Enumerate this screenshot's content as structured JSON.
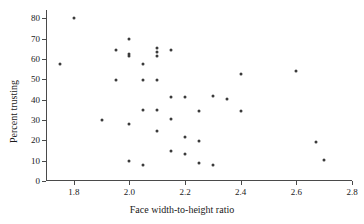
{
  "chart_data": {
    "type": "scatter",
    "title": "",
    "xlabel": "Face width-to-height ratio",
    "ylabel": "Percent trusting",
    "xlim": [
      1.7,
      2.8
    ],
    "ylim": [
      0,
      84
    ],
    "grid": false,
    "legend": "none",
    "xticks": [
      1.8,
      2.0,
      2.2,
      2.4,
      2.6,
      2.8
    ],
    "xtick_labels": [
      "1.8",
      "2.0",
      "2.2",
      "2.4",
      "2.6",
      "2.8"
    ],
    "yticks": [
      0,
      10,
      20,
      30,
      40,
      50,
      60,
      70,
      80
    ],
    "ytick_labels": [
      "0",
      "10",
      "20",
      "30",
      "40",
      "50",
      "60",
      "70",
      "80"
    ],
    "marker": "filled-circle",
    "marker_color": "#3b3b3b",
    "points": [
      {
        "x": 1.75,
        "y": 57.5
      },
      {
        "x": 1.8,
        "y": 80.0
      },
      {
        "x": 1.9,
        "y": 29.8
      },
      {
        "x": 1.95,
        "y": 64.5
      },
      {
        "x": 1.95,
        "y": 49.5
      },
      {
        "x": 2.0,
        "y": 69.7
      },
      {
        "x": 2.0,
        "y": 62.5
      },
      {
        "x": 2.0,
        "y": 61.3
      },
      {
        "x": 2.0,
        "y": 27.8
      },
      {
        "x": 2.0,
        "y": 9.8
      },
      {
        "x": 2.05,
        "y": 57.5
      },
      {
        "x": 2.05,
        "y": 49.5
      },
      {
        "x": 2.05,
        "y": 34.7
      },
      {
        "x": 2.05,
        "y": 8.0
      },
      {
        "x": 2.1,
        "y": 65.3
      },
      {
        "x": 2.1,
        "y": 63.3
      },
      {
        "x": 2.1,
        "y": 61.3
      },
      {
        "x": 2.1,
        "y": 49.5
      },
      {
        "x": 2.1,
        "y": 34.7
      },
      {
        "x": 2.1,
        "y": 24.8
      },
      {
        "x": 2.15,
        "y": 64.5
      },
      {
        "x": 2.15,
        "y": 41.5
      },
      {
        "x": 2.15,
        "y": 30.6
      },
      {
        "x": 2.15,
        "y": 14.7
      },
      {
        "x": 2.2,
        "y": 41.4
      },
      {
        "x": 2.2,
        "y": 21.5
      },
      {
        "x": 2.2,
        "y": 13.5
      },
      {
        "x": 2.25,
        "y": 34.5
      },
      {
        "x": 2.25,
        "y": 19.5
      },
      {
        "x": 2.25,
        "y": 8.6
      },
      {
        "x": 2.3,
        "y": 42.0
      },
      {
        "x": 2.3,
        "y": 7.7
      },
      {
        "x": 2.35,
        "y": 40.5
      },
      {
        "x": 2.4,
        "y": 52.4
      },
      {
        "x": 2.4,
        "y": 34.4
      },
      {
        "x": 2.6,
        "y": 53.8
      },
      {
        "x": 2.67,
        "y": 19.1
      },
      {
        "x": 2.7,
        "y": 10.1
      }
    ]
  }
}
